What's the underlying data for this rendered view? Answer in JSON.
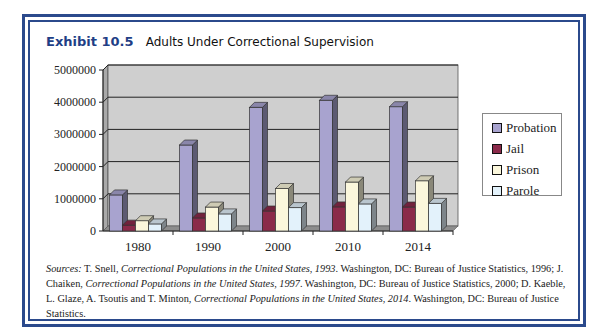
{
  "exhibit": {
    "number": "Exhibit 10.5",
    "title": "Adults Under Correctional Supervision"
  },
  "chart_data": {
    "type": "bar",
    "title": "Adults Under Correctional Supervision",
    "xlabel": "",
    "ylabel": "",
    "categories": [
      "1980",
      "1990",
      "2000",
      "2010",
      "2014"
    ],
    "series": [
      {
        "name": "Probation",
        "color": "#a8a3cf",
        "values": [
          1120000,
          2670000,
          3840000,
          4060000,
          3860000
        ]
      },
      {
        "name": "Jail",
        "color": "#8b2a4a",
        "values": [
          182000,
          405000,
          621000,
          749000,
          744000
        ]
      },
      {
        "name": "Prison",
        "color": "#fbf7dc",
        "values": [
          320000,
          743000,
          1320000,
          1520000,
          1560000
        ]
      },
      {
        "name": "Parole",
        "color": "#e3f2fb",
        "values": [
          220000,
          531000,
          726000,
          841000,
          857000
        ]
      }
    ],
    "yticks": [
      "0",
      "1000000",
      "2000000",
      "3000000",
      "4000000",
      "5000000"
    ],
    "ylim": [
      0,
      5000000
    ],
    "grid": true,
    "legend_position": "right",
    "style": "3d-clustered-column"
  },
  "legend": {
    "items": [
      {
        "label": "Probation",
        "color": "#a8a3cf"
      },
      {
        "label": "Jail",
        "color": "#8b2a4a"
      },
      {
        "label": "Prison",
        "color": "#fbf7dc"
      },
      {
        "label": "Parole",
        "color": "#e3f2fb"
      }
    ]
  },
  "sources": {
    "label": "Sources:",
    "s1_author": "T. Snell,",
    "s1_title": "Correctional Populations in the United States, 1993",
    "s1_pub": ". Washington, DC: Bureau of Justice Statistics, 1996;",
    "s2_author": "J. Chaiken,",
    "s2_title": "Correctional Populations in the United States, 1997",
    "s2_pub": ". Washington, DC: Bureau of Justice Statistics, 2000; D. Kaeble, L. Glaze, A. Tsoutis and T. Minton,",
    "s3_title": "Correctional Populations in the United States, 2014",
    "s3_pub": ". Washington, DC: Bureau of Justice Statistics."
  }
}
